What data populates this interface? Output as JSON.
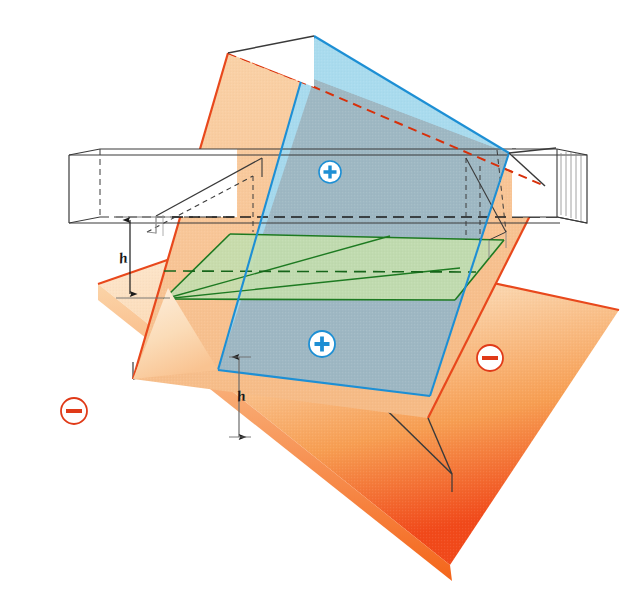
{
  "figure": {
    "labels": {
      "height_upper": "h",
      "height_lower": "h"
    },
    "badges": [
      {
        "id": "plus-upper",
        "symbol": "+",
        "polarity": "positive",
        "x": 330,
        "y": 172
      },
      {
        "id": "plus-lower",
        "symbol": "+",
        "polarity": "positive",
        "x": 322,
        "y": 344
      },
      {
        "id": "minus-right",
        "symbol": "−",
        "polarity": "negative",
        "x": 490,
        "y": 358
      },
      {
        "id": "minus-left",
        "symbol": "−",
        "polarity": "negative",
        "x": 74,
        "y": 411
      }
    ],
    "colors": {
      "positive_badge_fill": "#ffffff",
      "positive_badge_stroke": "#1d8fd4",
      "positive_badge_glyph": "#1d8fd4",
      "negative_badge_fill": "#ffffff",
      "negative_badge_stroke": "#e03a18",
      "negative_badge_glyph": "#e03a18",
      "blue_plane": "#a7d9ee",
      "blue_plane_edge": "#1d8fd4",
      "orange_plane": "#f8c596",
      "orange_plane_edge": "#e8481c",
      "overlap_plane": "#9db3bd",
      "green_plane": "#c3ddae",
      "green_plane_edge": "#1d7a21",
      "base_plate_light": "#fbe0c3",
      "base_plate_mid": "#f59a4e",
      "base_plate_deep": "#f03e12",
      "wire_outline": "#3a3a3a",
      "hidden_edge": "#3a3a3a",
      "intersection_dash": "#d8300a",
      "background": "#ffffff"
    },
    "elements": {
      "base_plate_name": "negative-base-plate",
      "inclined_plane_name": "orange-inclined-plane",
      "blue_plane_name": "blue-vertical-plane",
      "green_plane_name": "green-horizontal-plane",
      "beam_name": "white-rectangular-beam",
      "channel_name": "rectangular-channel"
    }
  }
}
